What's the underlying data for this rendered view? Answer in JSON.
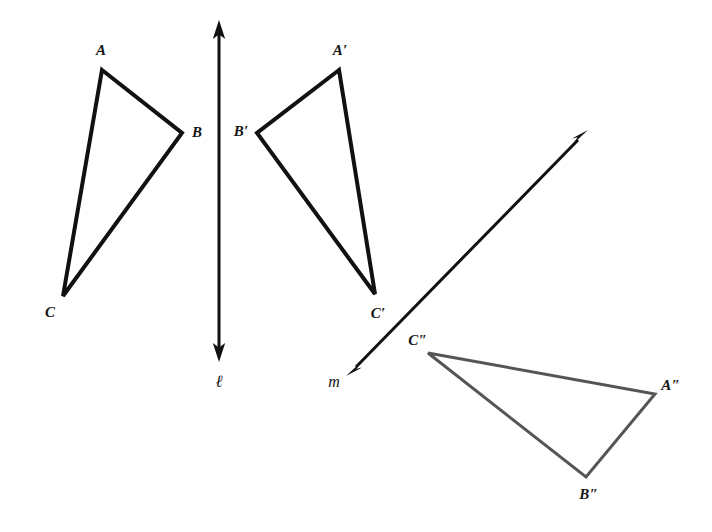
{
  "figure": {
    "background_color": "#ffffff",
    "width": 712,
    "height": 532
  },
  "colors": {
    "primary_stroke": "#111111",
    "secondary_stroke": "#555555",
    "label_color": "#151515"
  },
  "labels": {
    "a": "A",
    "b": "B",
    "c": "C",
    "a_prime": "A′",
    "b_prime": "B′",
    "c_prime": "C′",
    "a_double_prime": "A″",
    "b_double_prime": "B″",
    "c_double_prime": "C″",
    "line_l": "ℓ",
    "line_m": "m"
  },
  "geometry": {
    "triangles": [
      {
        "name": "triangle-abc",
        "stroke": "#111111",
        "stroke_width": 4,
        "vertices": [
          {
            "label": "A",
            "x": 102,
            "y": 70
          },
          {
            "label": "B",
            "x": 182,
            "y": 133
          },
          {
            "label": "C",
            "x": 63,
            "y": 296
          }
        ],
        "label_positions": [
          {
            "label": "A",
            "x": 101,
            "y": 50
          },
          {
            "label": "B",
            "x": 197,
            "y": 132
          },
          {
            "label": "C",
            "x": 50,
            "y": 312
          }
        ]
      },
      {
        "name": "triangle-a-prime-b-prime-c-prime",
        "stroke": "#111111",
        "stroke_width": 4,
        "vertices": [
          {
            "label": "A′",
            "x": 339,
            "y": 70
          },
          {
            "label": "B′",
            "x": 257,
            "y": 133
          },
          {
            "label": "C′",
            "x": 375,
            "y": 294
          }
        ],
        "label_positions": [
          {
            "label": "A′",
            "x": 340,
            "y": 50
          },
          {
            "label": "B′",
            "x": 241,
            "y": 131
          },
          {
            "label": "C′",
            "x": 378,
            "y": 313
          }
        ]
      },
      {
        "name": "triangle-a-double-prime-b-double-prime-c-double-prime",
        "stroke": "#555555",
        "stroke_width": 3,
        "vertices": [
          {
            "label": "C″",
            "x": 428,
            "y": 353
          },
          {
            "label": "A″",
            "x": 655,
            "y": 394
          },
          {
            "label": "B″",
            "x": 586,
            "y": 477
          }
        ],
        "label_positions": [
          {
            "label": "C″",
            "x": 418,
            "y": 340
          },
          {
            "label": "A″",
            "x": 671,
            "y": 385
          },
          {
            "label": "B″",
            "x": 589,
            "y": 494
          }
        ]
      }
    ],
    "lines": [
      {
        "name": "line-l",
        "label": "ℓ",
        "stroke": "#111111",
        "stroke_width": 3,
        "x1": 219,
        "y1": 22,
        "x2": 219,
        "y2": 360,
        "arrow_start": true,
        "arrow_end": true,
        "label_x": 219,
        "label_y": 381
      },
      {
        "name": "line-m",
        "label": "m",
        "stroke": "#111111",
        "stroke_width": 3,
        "x1": 586,
        "y1": 132,
        "x2": 348,
        "y2": 375,
        "arrow_start": true,
        "arrow_end": true,
        "label_x": 334,
        "label_y": 382
      }
    ]
  }
}
